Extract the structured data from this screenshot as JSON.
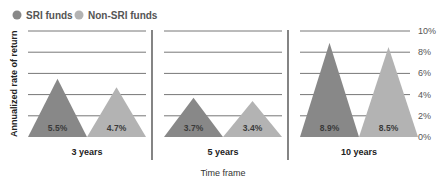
{
  "chart_data": {
    "type": "bar",
    "mark_shape": "triangle",
    "title": "",
    "xlabel": "Time frame",
    "ylabel": "Annualized rate of return",
    "ylim": [
      0,
      10
    ],
    "yticks": [
      0,
      2,
      4,
      6,
      8,
      10
    ],
    "ytick_labels": [
      "0%",
      "2%",
      "4%",
      "6%",
      "8%",
      "10%"
    ],
    "grid": true,
    "legend_position": "top-left",
    "categories": [
      "3 years",
      "5 years",
      "10 years"
    ],
    "series": [
      {
        "name": "SRI funds",
        "color": "#888888",
        "values": [
          5.5,
          3.7,
          8.9
        ],
        "labels": [
          "5.5%",
          "3.7%",
          "8.9%"
        ]
      },
      {
        "name": "Non-SRI funds",
        "color": "#b3b3b3",
        "values": [
          4.7,
          3.4,
          8.5
        ],
        "labels": [
          "4.7%",
          "3.4%",
          "8.5%"
        ]
      }
    ]
  }
}
